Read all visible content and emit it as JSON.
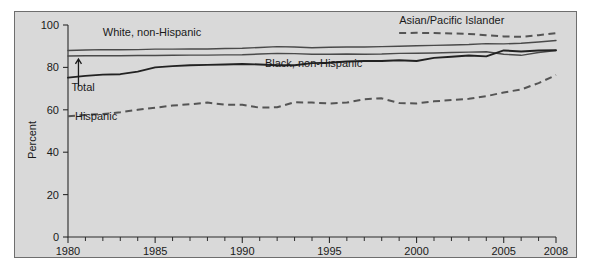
{
  "chart_data": {
    "type": "line",
    "title": "",
    "subtitle": "",
    "xlabel": "",
    "ylabel": "Percent",
    "xlim": [
      1980,
      2008
    ],
    "ylim": [
      0,
      100
    ],
    "grid": false,
    "legend_position": "inline-labels",
    "y_ticks": [
      0,
      20,
      40,
      60,
      80,
      100
    ],
    "y_tick_labels": [
      "0",
      "20",
      "40",
      "60",
      "80",
      "100"
    ],
    "x_ticks": [
      1980,
      1985,
      1990,
      1995,
      2000,
      2005,
      2008
    ],
    "x_tick_labels": [
      "1980",
      "1985",
      "1990",
      "1995",
      "2000",
      "2005",
      "2008"
    ],
    "x_minor_ticks": [
      1981,
      1982,
      1983,
      1984,
      1986,
      1987,
      1988,
      1989,
      1991,
      1992,
      1993,
      1994,
      1996,
      1997,
      1998,
      1999,
      2001,
      2002,
      2003,
      2004,
      2006,
      2007
    ],
    "x": [
      1980,
      1981,
      1982,
      1983,
      1984,
      1985,
      1986,
      1987,
      1988,
      1989,
      1990,
      1991,
      1992,
      1993,
      1994,
      1995,
      1996,
      1997,
      1998,
      1999,
      2000,
      2001,
      2002,
      2003,
      2004,
      2005,
      2006,
      2007,
      2008
    ],
    "series": [
      {
        "name": "White, non-Hispanic",
        "style": "solid-thin",
        "label_anchor_year": 1982.0,
        "label_anchor_value": 95.0,
        "values": [
          88.0,
          88.2,
          88.4,
          88.3,
          88.4,
          88.6,
          88.6,
          88.7,
          88.7,
          88.9,
          89.0,
          89.4,
          89.8,
          89.6,
          89.3,
          89.5,
          89.6,
          89.6,
          89.8,
          90.0,
          90.2,
          90.4,
          90.6,
          90.8,
          91.2,
          91.1,
          91.4,
          92.0,
          92.7
        ]
      },
      {
        "name": "Total",
        "style": "solid-thin",
        "label_anchor_year": 1980.2,
        "label_anchor_value": 69.0,
        "values": [
          85.4,
          85.5,
          85.5,
          85.5,
          85.6,
          85.6,
          85.7,
          85.8,
          85.8,
          85.9,
          86.0,
          86.3,
          86.6,
          86.5,
          86.2,
          86.2,
          86.3,
          86.2,
          86.3,
          86.6,
          86.7,
          86.8,
          87.0,
          87.2,
          87.4,
          86.2,
          85.7,
          87.0,
          88.0
        ]
      },
      {
        "name": "Black, non-Hispanic",
        "style": "solid-thick",
        "label_anchor_year": 1991.3,
        "label_anchor_value": 80.0,
        "values": [
          75.2,
          76.0,
          76.6,
          76.8,
          78.0,
          80.0,
          80.6,
          81.0,
          81.2,
          81.4,
          81.6,
          81.4,
          81.0,
          81.0,
          82.0,
          82.2,
          82.8,
          83.0,
          83.0,
          83.4,
          83.0,
          84.5,
          85.0,
          85.6,
          85.2,
          88.0,
          87.5,
          88.0,
          88.1
        ]
      },
      {
        "name": "Hispanic",
        "style": "dashed",
        "label_anchor_year": 1980.4,
        "label_anchor_value": 55.0,
        "values": [
          57.0,
          57.6,
          58.0,
          58.8,
          60.0,
          61.0,
          62.0,
          62.6,
          63.4,
          62.4,
          62.4,
          61.0,
          61.2,
          63.6,
          63.4,
          63.0,
          63.4,
          65.0,
          65.4,
          63.2,
          63.0,
          64.0,
          64.6,
          65.2,
          66.4,
          68.2,
          69.6,
          72.6,
          76.4
        ]
      },
      {
        "name": "Asian/Pacific Islander",
        "style": "dashed",
        "label_anchor_year": 1999.0,
        "label_anchor_value": 100.5,
        "start_year": 1999,
        "values": [
          null,
          null,
          null,
          null,
          null,
          null,
          null,
          null,
          null,
          null,
          null,
          null,
          null,
          null,
          null,
          null,
          null,
          null,
          null,
          96.2,
          96.3,
          96.2,
          96.0,
          95.8,
          95.2,
          94.6,
          94.4,
          95.2,
          96.1
        ]
      }
    ],
    "annotations": [
      {
        "name": "total-arrow",
        "text": "",
        "from_year": 1980.6,
        "from_value": 71.0,
        "to_year": 1980.6,
        "to_value": 84.0
      }
    ]
  },
  "labels": {
    "white": "White, non-Hispanic",
    "total": "Total",
    "black": "Black, non-Hispanic",
    "hispanic": "Hispanic",
    "asian": "Asian/Pacific Islander",
    "ylabel": "Percent"
  },
  "ticks": {
    "y": [
      "100",
      "80",
      "60",
      "40",
      "20",
      "0"
    ],
    "x": [
      "1980",
      "1985",
      "1990",
      "1995",
      "2000",
      "2005",
      "2008"
    ]
  },
  "colors": {
    "background": "#d9d9d9",
    "page": "#ffffff",
    "frame_border": "#6e6e6e",
    "axis": "#2b2b2b",
    "line_thin": "#4a4a4a",
    "line_thick": "#222222",
    "line_dashed": "#555555",
    "text": "#1a1a1a"
  }
}
